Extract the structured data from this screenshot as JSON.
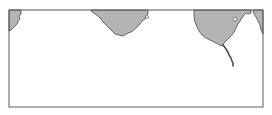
{
  "map": {
    "type": "coastline-outline-map",
    "colors": {
      "background": "#ffffff",
      "land": "#b4b4b4",
      "coastline": "#4a4a4a",
      "frame": "#5a5a5a"
    },
    "frame": {
      "x": 9,
      "y": 10,
      "width": 254,
      "height": 97
    },
    "landmasses": [
      {
        "name": "landmass-left-edge"
      },
      {
        "name": "landmass-center-peninsula"
      },
      {
        "name": "landmass-right-peninsula"
      },
      {
        "name": "landmass-far-right-edge"
      }
    ],
    "features": [
      {
        "name": "river-line"
      },
      {
        "name": "lake-marker"
      }
    ]
  }
}
